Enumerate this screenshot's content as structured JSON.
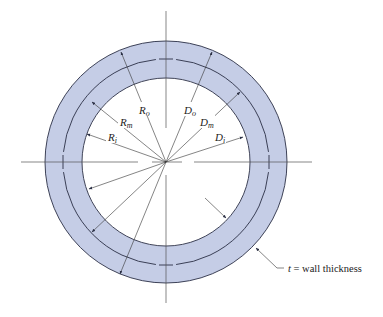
{
  "diagram": {
    "type": "pipe-cross-section",
    "colors": {
      "ring_fill": "#c5cde6",
      "stroke": "#2a2f45",
      "axis": "#555555",
      "background": "#ffffff"
    },
    "geometry": {
      "center": [
        166,
        162
      ],
      "outer_radius": 121,
      "mid_radius": 103,
      "inner_radius": 84
    },
    "labels": {
      "R_o": {
        "main": "R",
        "sub": "o"
      },
      "R_m": {
        "main": "R",
        "sub": "m"
      },
      "R_i": {
        "main": "R",
        "sub": "i"
      },
      "D_o": {
        "main": "D",
        "sub": "o"
      },
      "D_m": {
        "main": "D",
        "sub": "m"
      },
      "D_i": {
        "main": "D",
        "sub": "i"
      }
    },
    "annotation": {
      "symbol": "t",
      "equals": " = wall thickness"
    }
  }
}
